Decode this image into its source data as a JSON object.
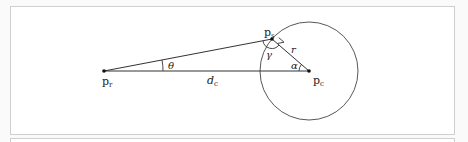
{
  "figure": {
    "labels": {
      "p_r": {
        "main": "p",
        "sub": "r"
      },
      "p_s": {
        "main": "p",
        "sub": "s"
      },
      "p_c": {
        "main": "p",
        "sub": "c"
      },
      "d_c": {
        "main": "d",
        "sub": "c"
      },
      "theta": "θ",
      "gamma": "γ",
      "alpha": "α",
      "r": "r"
    },
    "colors": {
      "line": "#333333",
      "frame": "#cfcfcf"
    }
  }
}
